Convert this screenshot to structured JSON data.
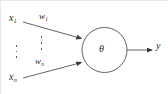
{
  "diagram": {
    "type": "neuron-schematic",
    "stroke_color": "#3a3a3a",
    "text_color": "#2a2a2a",
    "background_color": "#ffffff",
    "inputs": [
      {
        "id": "input-1",
        "variable": "x",
        "subscript": "1",
        "weight_variable": "w",
        "weight_subscript": "1"
      },
      {
        "id": "input-n",
        "variable": "x",
        "subscript": "n",
        "weight_variable": "w",
        "weight_subscript": "n"
      }
    ],
    "node": {
      "symbol": "θ",
      "name": "theta-threshold-node"
    },
    "output": {
      "variable": "y"
    },
    "ellipses": [
      {
        "id": "inputs-ellipsis",
        "dot_count": 3,
        "orientation": "vertical"
      },
      {
        "id": "weights-ellipsis",
        "dot_count": 3,
        "orientation": "vertical"
      }
    ]
  }
}
